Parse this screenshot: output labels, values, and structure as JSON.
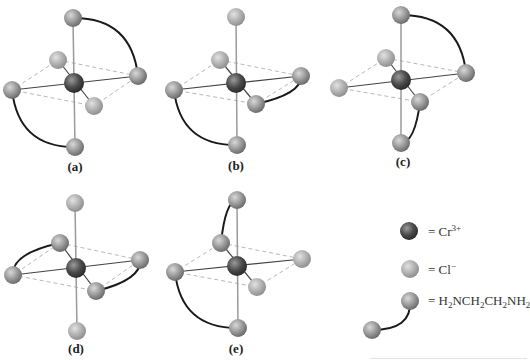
{
  "figure": {
    "panels": [
      {
        "id": "a",
        "label": "(a)",
        "label_pos": [
          75,
          168
        ],
        "atoms": {
          "top": [
            73,
            18
          ],
          "back_left": [
            58,
            60
          ],
          "center": [
            74,
            83
          ],
          "right": [
            138,
            76
          ],
          "left": [
            12,
            90
          ],
          "front_right": [
            94,
            106
          ],
          "bottom": [
            75,
            147
          ]
        },
        "ligand_types": {
          "top": "en",
          "right": "en",
          "left": "en",
          "bottom": "en",
          "back_left": "Cl",
          "front_right": "Cl"
        },
        "chelates": [
          [
            "top",
            "right"
          ],
          [
            "left",
            "bottom"
          ]
        ]
      },
      {
        "id": "b",
        "label": "(b)",
        "label_pos": [
          236,
          167
        ],
        "atoms": {
          "top": [
            236,
            17
          ],
          "back_left": [
            220,
            60
          ],
          "center": [
            236,
            83
          ],
          "right": [
            301,
            76
          ],
          "left": [
            174,
            90
          ],
          "front_right": [
            256,
            104
          ],
          "bottom": [
            237,
            145
          ]
        },
        "ligand_types": {
          "top": "Cl",
          "back_left": "Cl",
          "right": "en",
          "front_right": "en",
          "left": "en",
          "bottom": "en"
        },
        "chelates": [
          [
            "right",
            "front_right"
          ],
          [
            "left",
            "bottom"
          ]
        ]
      },
      {
        "id": "c",
        "label": "(c)",
        "label_pos": [
          403,
          163
        ],
        "atoms": {
          "top": [
            401,
            15
          ],
          "back_left": [
            386,
            58
          ],
          "center": [
            401,
            80
          ],
          "right": [
            466,
            73
          ],
          "left": [
            339,
            88
          ],
          "front_right": [
            420,
            102
          ],
          "bottom": [
            401,
            143
          ]
        },
        "ligand_types": {
          "top": "en",
          "right": "en",
          "front_right": "en",
          "bottom": "en",
          "back_left": "Cl",
          "left": "Cl"
        },
        "chelates": [
          [
            "top",
            "right"
          ],
          [
            "front_right",
            "bottom"
          ]
        ]
      },
      {
        "id": "d",
        "label": "(d)",
        "label_pos": [
          76,
          350
        ],
        "atoms": {
          "top": [
            75,
            203
          ],
          "back_left": [
            60,
            243
          ],
          "center": [
            76,
            268
          ],
          "right": [
            140,
            260
          ],
          "left": [
            13,
            275
          ],
          "front_right": [
            96,
            291
          ],
          "bottom": [
            77,
            331
          ]
        },
        "ligand_types": {
          "top": "Cl",
          "bottom": "Cl",
          "back_left": "en",
          "left": "en",
          "right": "en",
          "front_right": "en"
        },
        "chelates": [
          [
            "back_left",
            "left"
          ],
          [
            "right",
            "front_right"
          ]
        ]
      },
      {
        "id": "e",
        "label": "(e)",
        "label_pos": [
          236,
          350
        ],
        "atoms": {
          "top": [
            237,
            200
          ],
          "back_left": [
            221,
            243
          ],
          "center": [
            237,
            266
          ],
          "right": [
            302,
            259
          ],
          "left": [
            175,
            272
          ],
          "front_right": [
            257,
            287
          ],
          "bottom": [
            238,
            328
          ]
        },
        "ligand_types": {
          "top": "en",
          "back_left": "en",
          "left": "en",
          "bottom": "en",
          "right": "Cl",
          "front_right": "Cl"
        },
        "chelates": [
          [
            "top",
            "back_left"
          ],
          [
            "left",
            "bottom"
          ]
        ]
      }
    ],
    "legend": {
      "items": [
        {
          "key": "cr",
          "symbol": "Cr",
          "charge": "3+",
          "sphere": [
            409,
            231
          ],
          "text_pos": [
            428,
            223
          ]
        },
        {
          "key": "cl",
          "symbol": "Cl",
          "charge": "−",
          "sphere": [
            410,
            269
          ],
          "text_pos": [
            428,
            261
          ]
        },
        {
          "key": "en",
          "formula": [
            "H",
            "2",
            "NCH",
            "2",
            "CH",
            "2",
            "NH",
            "2"
          ],
          "sphere": [
            410,
            301
          ],
          "tail": [
            372,
            330
          ],
          "text_pos": [
            428,
            293
          ]
        }
      ],
      "equals": "= "
    },
    "colors": {
      "cr_dark": "#3a3a3a",
      "cr_light": "#8a8a8a",
      "cl_dark": "#8c8c8c",
      "cl_light": "#d6d6d6",
      "en_dark": "#6a6a6a",
      "en_light": "#c4c4c4",
      "bond_axial": "#9a9a9a",
      "bond_plane": "#444444",
      "dashed": "#b8b8b8",
      "chelate": "#1a1a1a"
    }
  }
}
